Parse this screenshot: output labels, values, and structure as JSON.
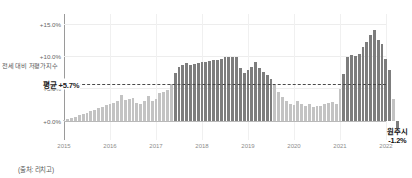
{
  "chart_data": {
    "type": "bar",
    "title": "",
    "subtitle": "",
    "xlabel": "",
    "ylabel": "전세 대비 저평가지수",
    "ylim": [
      -3.0,
      16.5
    ],
    "ytick_labels": [
      "+15.0%",
      "+10.0%",
      "+5.0%",
      "+0.0%"
    ],
    "ytick_values": [
      15.0,
      10.0,
      5.0,
      0.0
    ],
    "xtick_labels": [
      "2015",
      "2016",
      "2017",
      "2018",
      "2019",
      "2020",
      "2021",
      "2022"
    ],
    "xtick_values": [
      2015,
      2016,
      2017,
      2018,
      2019,
      2020,
      2021,
      2022
    ],
    "grid": true,
    "legend": "none",
    "series_name": "전세 대비 저평가지수",
    "x_start": 2015.0,
    "x_end": 2022.0,
    "bar_interval_years": 0.0833,
    "colors": {
      "bar_below_average": "#c3c3c3",
      "bar_above_average": "#7d7d7d",
      "average_line": "#4a4a4a",
      "zero_line": "#b9b9b9",
      "gridline": "#ededed",
      "axis": "#9a9a9a",
      "background": "#ffffff"
    },
    "annotations": [
      {
        "name": "average-line",
        "label": "평균 +5.7%",
        "value": 5.7,
        "style": "dashed-horizontal"
      },
      {
        "name": "final-point-callout",
        "label_line1": "원주시",
        "label_line2": "-1.2%",
        "value": -1.2
      }
    ],
    "x": [
      2015.0,
      2015.08,
      2015.17,
      2015.25,
      2015.33,
      2015.42,
      2015.5,
      2015.58,
      2015.67,
      2015.75,
      2015.83,
      2015.92,
      2016.0,
      2016.08,
      2016.17,
      2016.25,
      2016.33,
      2016.42,
      2016.5,
      2016.58,
      2016.67,
      2016.75,
      2016.83,
      2016.92,
      2017.0,
      2017.08,
      2017.17,
      2017.25,
      2017.33,
      2017.42,
      2017.5,
      2017.58,
      2017.67,
      2017.75,
      2017.83,
      2017.92,
      2018.0,
      2018.08,
      2018.17,
      2018.25,
      2018.33,
      2018.42,
      2018.5,
      2018.58,
      2018.67,
      2018.75,
      2018.83,
      2018.92,
      2019.0,
      2019.08,
      2019.17,
      2019.25,
      2019.33,
      2019.42,
      2019.5,
      2019.58,
      2019.67,
      2019.75,
      2019.83,
      2019.92,
      2020.0,
      2020.08,
      2020.17,
      2020.25,
      2020.33,
      2020.42,
      2020.5,
      2020.58,
      2020.67,
      2020.75,
      2020.83,
      2020.92,
      2021.0,
      2021.08,
      2021.17,
      2021.25,
      2021.33,
      2021.42,
      2021.5,
      2021.58,
      2021.67,
      2021.75,
      2021.83
    ],
    "values": [
      0.1,
      0.2,
      0.4,
      0.6,
      0.8,
      1.0,
      1.2,
      1.5,
      1.7,
      1.9,
      2.1,
      2.4,
      2.6,
      2.8,
      3.0,
      3.9,
      3.2,
      3.3,
      3.5,
      2.8,
      2.6,
      3.0,
      3.8,
      3.1,
      3.4,
      4.3,
      4.5,
      4.8,
      5.6,
      7.3,
      8.3,
      8.6,
      8.9,
      8.6,
      8.7,
      8.9,
      9.1,
      9.0,
      9.2,
      9.4,
      9.4,
      9.6,
      9.8,
      9.9,
      9.8,
      9.9,
      8.1,
      7.4,
      7.8,
      8.3,
      9.0,
      8.2,
      7.5,
      7.0,
      6.4,
      5.5,
      4.4,
      3.6,
      3.0,
      2.6,
      2.4,
      3.0,
      2.5,
      2.2,
      2.5,
      2.1,
      2.2,
      2.3,
      2.6,
      2.8,
      2.9,
      2.5,
      4.9,
      7.2,
      9.9,
      10.1,
      10.0,
      10.3,
      11.4,
      12.2,
      13.3,
      14.0,
      12.4
    ],
    "tail_values": [
      11.8,
      9.5,
      7.9,
      3.3,
      -1.2
    ],
    "average": 5.7
  },
  "footer": {
    "source": "(출처: 리치고)"
  }
}
